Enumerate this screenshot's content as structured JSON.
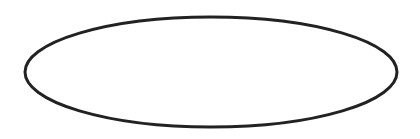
{
  "diagram": {
    "background": "#ffffff",
    "shapes": [
      {
        "type": "ellipse",
        "cx": 211,
        "cy": 72,
        "rx": 186,
        "ry": 55,
        "stroke": "#222222",
        "stroke_width": 3,
        "fill": "none",
        "label": ""
      }
    ]
  }
}
